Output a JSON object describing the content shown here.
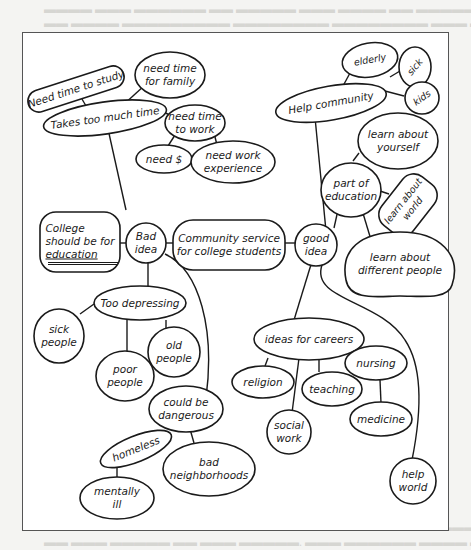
{
  "diagram": {
    "type": "cluster-map",
    "center": "Community service for college students",
    "nodes": {
      "center": "Community service\nfor college students",
      "bad_idea": "Bad\nidea",
      "good_idea": "good\nidea",
      "college_education_line1": "College",
      "college_education_line2": "should be for",
      "college_education_line3": "education",
      "takes_too_much_time": "Takes too much time",
      "need_time_to_study": "Need time to study",
      "need_time_family": "need time\nfor family",
      "need_time_work": "need time\nto work",
      "need_money": "need $",
      "need_work_experience": "need work\nexperience",
      "too_depressing": "Too depressing",
      "sick_people": "sick\npeople",
      "poor_people": "poor\npeople",
      "old_people": "old\npeople",
      "could_be_dangerous": "could be\ndangerous",
      "homeless": "homeless",
      "mentally_ill": "mentally\nill",
      "bad_neighborhoods": "bad\nneighborhoods",
      "help_community": "Help community",
      "elderly": "elderly",
      "sick": "sick",
      "kids": "kids",
      "learn_yourself": "learn about\nyourself",
      "part_of_education": "part of\neducation",
      "learn_world": "learn about\nworld",
      "learn_different_people": "learn about\ndifferent people",
      "ideas_for_careers": "ideas for careers",
      "religion": "religion",
      "teaching": "teaching",
      "social_work": "social\nwork",
      "nursing": "nursing",
      "medicine": "medicine",
      "help_world": "help\nworld"
    },
    "colors": {
      "stroke": "#1a1a1a",
      "fill": "#ffffff",
      "page": "#f4f4f2",
      "bleed_text": "#d6d6d2"
    }
  }
}
